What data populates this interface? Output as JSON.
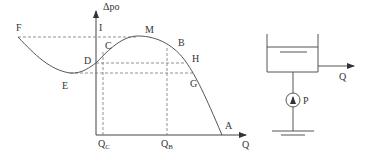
{
  "chart": {
    "y_axis_label": "Δpo",
    "x_axis_label": "Q",
    "points": {
      "F": "F",
      "I": "I",
      "M": "M",
      "C": "C",
      "B": "B",
      "D": "D",
      "H": "H",
      "E": "E",
      "G": "G",
      "A": "A"
    },
    "ticks": {
      "qc_main": "Q",
      "qc_sub": "C",
      "qb_main": "Q",
      "qb_sub": "B"
    }
  },
  "system": {
    "outlet_label": "Q",
    "pump_label": "P"
  },
  "colors": {
    "line": "#555555",
    "dash": "#777777",
    "text": "#333333"
  }
}
